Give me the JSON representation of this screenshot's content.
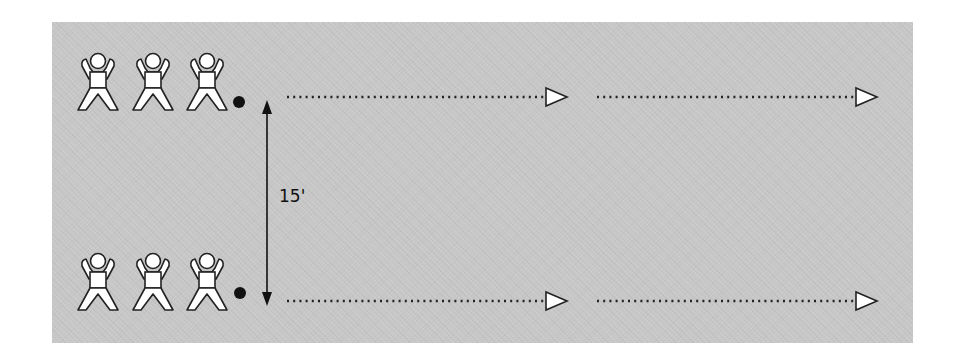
{
  "diagram": {
    "distance_label": "15'",
    "background_color": "#c9c9c9",
    "rows": [
      {
        "name": "top-row",
        "players": [
          {
            "x": 98,
            "y": 52
          },
          {
            "x": 153,
            "y": 52
          },
          {
            "x": 207,
            "y": 52
          }
        ],
        "ball": {
          "x": 239,
          "y": 102
        },
        "runs": [
          {
            "x1": 287,
            "x2": 545,
            "y": 97,
            "tip": 567
          },
          {
            "x1": 597,
            "x2": 855,
            "y": 97,
            "tip": 877
          }
        ]
      },
      {
        "name": "bottom-row",
        "players": [
          {
            "x": 98,
            "y": 252
          },
          {
            "x": 153,
            "y": 252
          },
          {
            "x": 207,
            "y": 252
          }
        ],
        "ball": {
          "x": 240,
          "y": 293
        },
        "runs": [
          {
            "x1": 287,
            "x2": 545,
            "y": 301,
            "tip": 567
          },
          {
            "x1": 597,
            "x2": 855,
            "y": 301,
            "tip": 877
          }
        ]
      }
    ],
    "distance_arrow": {
      "x": 267,
      "y1": 101,
      "y2": 305
    }
  }
}
